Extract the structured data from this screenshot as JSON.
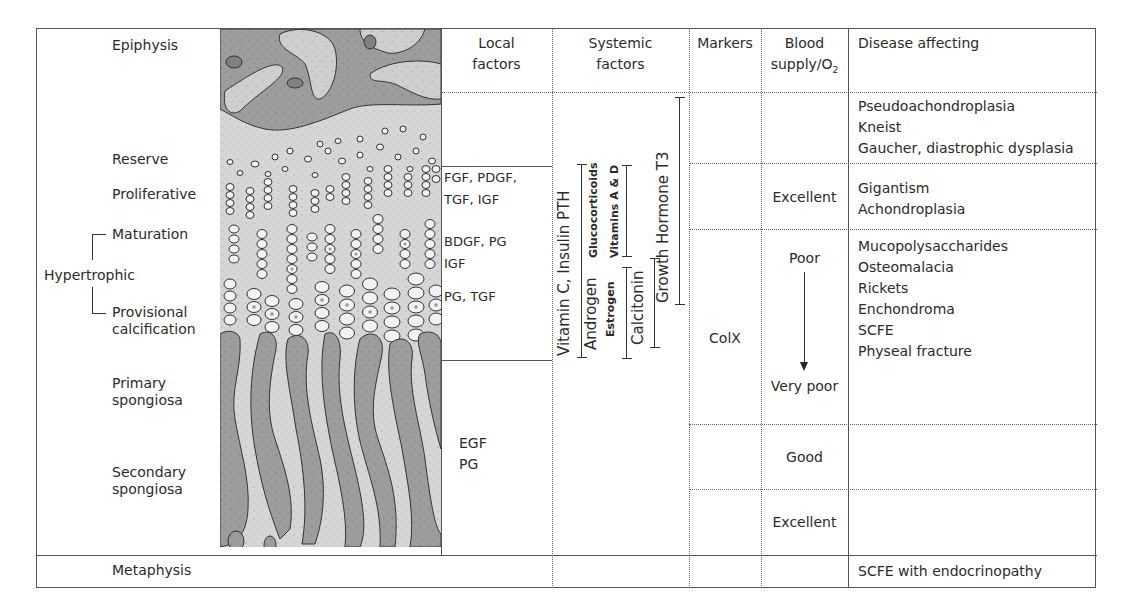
{
  "headers": {
    "local_factors": [
      "Local",
      "factors"
    ],
    "systemic_factors": [
      "Systemic",
      "factors"
    ],
    "markers": "Markers",
    "blood_supply": [
      "Blood",
      "supply/O",
      "2"
    ],
    "disease_affecting": "Disease affecting"
  },
  "zones": {
    "epiphysis": "Epiphysis",
    "reserve": "Reserve",
    "proliferative": "Proliferative",
    "maturation": "Maturation",
    "hypertrophic": "Hypertrophic",
    "provisional_calcification": [
      "Provisional",
      "calcification"
    ],
    "primary_spongiosa": [
      "Primary",
      "spongiosa"
    ],
    "secondary_spongiosa": [
      "Secondary",
      "spongiosa"
    ],
    "metaphysis": "Metaphysis"
  },
  "local_factors": {
    "proliferative": [
      "FGF, PDGF,",
      "TGF, IGF"
    ],
    "maturation": [
      "BDGF, PG",
      "IGF"
    ],
    "calcification": "PG, TGF",
    "spongiosa": [
      "EGF",
      "PG"
    ]
  },
  "systemic_factors": {
    "vitamin_c_insulin_pth": "Vitamin C, Insulin PTH",
    "androgen": "Androgen",
    "glucocorticoids": "Glucocorticoids",
    "estrogen": "Estrogen",
    "vitamins_a_d": "Vitamins A & D",
    "calcitonin": "Calcitonin",
    "growth_hormone_t3": "Growth Hormone T3"
  },
  "markers": {
    "hypertrophic": "ColX"
  },
  "blood_supply": {
    "proliferative": "Excellent",
    "hypertrophic_top": "Poor",
    "hypertrophic_bottom": "Very poor",
    "primary_spongiosa": "Good",
    "secondary_spongiosa": "Excellent"
  },
  "diseases": {
    "reserve": [
      "Pseudoachondroplasia",
      "Kneist",
      "Gaucher, diastrophic dysplasia"
    ],
    "proliferative": [
      "Gigantism",
      "Achondroplasia"
    ],
    "hypertrophic": [
      "Mucopolysaccharides",
      "Osteomalacia",
      "Rickets",
      "Enchondroma",
      "SCFE",
      "Physeal fracture"
    ],
    "metaphysis": "SCFE with endocrinopathy"
  },
  "colors": {
    "bone": "#9a9a9a",
    "cartilage": "#d8d8d8",
    "cell_fill": "#f4f4f4",
    "outline": "#333333"
  }
}
